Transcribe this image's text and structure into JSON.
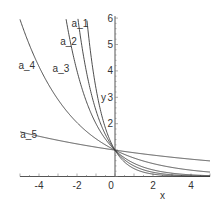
{
  "chart_data": {
    "type": "line",
    "title": "",
    "xlabel": "x",
    "ylabel": "y",
    "xlim": [
      -5,
      5
    ],
    "ylim": [
      0,
      6
    ],
    "grid": false,
    "legend": "inline labels on curves",
    "x_ticks": [
      -4,
      -2,
      0,
      2,
      4
    ],
    "y_ticks": [
      1,
      2,
      3,
      4,
      5,
      6
    ],
    "x_tick_labels": [
      "-4",
      "-2",
      "0",
      "2",
      "4"
    ],
    "y_tick_labels": [
      "2",
      "3",
      "4",
      "5",
      "6"
    ],
    "function": "y = a^x",
    "series": [
      {
        "name": "a_1",
        "base": 0.3,
        "label_x": -1.3,
        "label_y": 5.8
      },
      {
        "name": "a_2",
        "base": 0.4,
        "label_x": -1.9,
        "label_y": 5.1
      },
      {
        "name": "a_3",
        "base": 0.5,
        "label_x": -2.3,
        "label_y": 4.1
      },
      {
        "name": "a_4",
        "base": 0.7,
        "label_x": -4.1,
        "label_y": 4.2
      },
      {
        "name": "a_5",
        "base": 0.9,
        "label_x": -4.0,
        "label_y": 1.6
      }
    ],
    "annotations": []
  },
  "colors": {
    "curve": "#3a3a3a",
    "axis": "#555555",
    "background": "#ffffff"
  }
}
